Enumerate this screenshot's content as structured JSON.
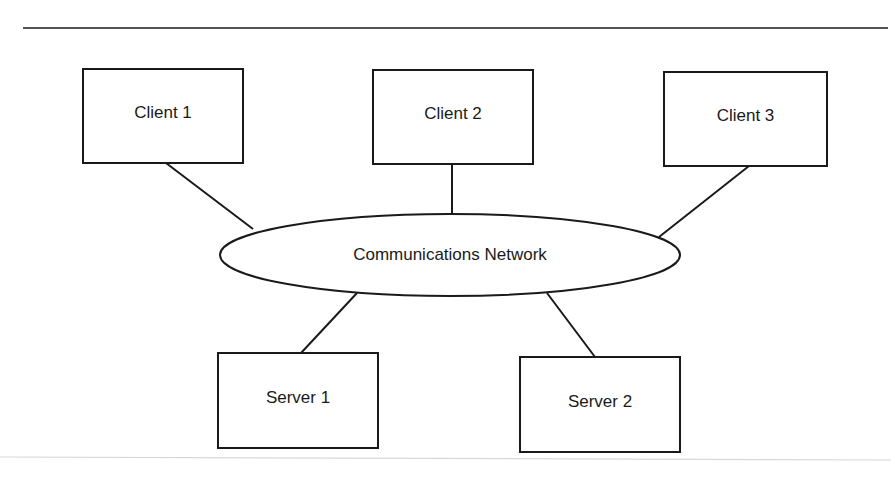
{
  "diagram": {
    "title": "",
    "network": {
      "label": "Communications Network",
      "cx": 450,
      "cy": 255,
      "rx": 230,
      "ry": 41
    },
    "clients": [
      {
        "label": "Client 1",
        "x": 83,
        "y": 69,
        "w": 160,
        "h": 94
      },
      {
        "label": "Client 2",
        "x": 373,
        "y": 70,
        "w": 160,
        "h": 94
      },
      {
        "label": "Client 3",
        "x": 664,
        "y": 72,
        "w": 163,
        "h": 94
      }
    ],
    "servers": [
      {
        "label": "Server 1",
        "x": 218,
        "y": 353,
        "w": 160,
        "h": 95
      },
      {
        "label": "Server 2",
        "x": 520,
        "y": 357,
        "w": 160,
        "h": 95
      }
    ],
    "links": [
      {
        "from": "Client 1",
        "to": "Communications Network",
        "x1": 166,
        "y1": 163,
        "x2": 253,
        "y2": 229
      },
      {
        "from": "Client 2",
        "to": "Communications Network",
        "x1": 452,
        "y1": 164,
        "x2": 452,
        "y2": 213
      },
      {
        "from": "Client 3",
        "to": "Communications Network",
        "x1": 749,
        "y1": 166,
        "x2": 659,
        "y2": 237
      },
      {
        "from": "Communications Network",
        "to": "Server 1",
        "x1": 357,
        "y1": 293,
        "x2": 301,
        "y2": 353
      },
      {
        "from": "Communications Network",
        "to": "Server 2",
        "x1": 547,
        "y1": 293,
        "x2": 595,
        "y2": 357
      }
    ],
    "colors": {
      "stroke": "#1a1a1a",
      "background": "#ffffff"
    }
  }
}
